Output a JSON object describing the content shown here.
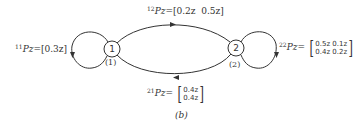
{
  "diagram": {
    "type": "state-transition-graph",
    "caption": "(b)",
    "nodes": [
      {
        "id": "1",
        "label": "1",
        "sublabel": "(1)"
      },
      {
        "id": "2",
        "label": "2",
        "sublabel": "(2)"
      }
    ],
    "edges": [
      {
        "from": "1",
        "to": "1",
        "sup": "11",
        "name": "Pz",
        "eq": "=",
        "value": "[0.3z]"
      },
      {
        "from": "1",
        "to": "2",
        "sup": "12",
        "name": "Pz",
        "eq": "=",
        "value": "[0.2z  0.5z]"
      },
      {
        "from": "2",
        "to": "2",
        "sup": "22",
        "name": "Pz",
        "eq": "=",
        "matrix": [
          [
            "0.5z",
            "0.1z"
          ],
          [
            "0.4z",
            "0.2z"
          ]
        ],
        "row0": "0.5z 0.1z",
        "row1": "0.4z 0.2z"
      },
      {
        "from": "2",
        "to": "1",
        "sup": "21",
        "name": "Pz",
        "eq": "=",
        "matrix": [
          [
            "0.4z"
          ],
          [
            "0.4z"
          ]
        ],
        "row0": "0.4z",
        "row1": "0.4z"
      }
    ]
  }
}
